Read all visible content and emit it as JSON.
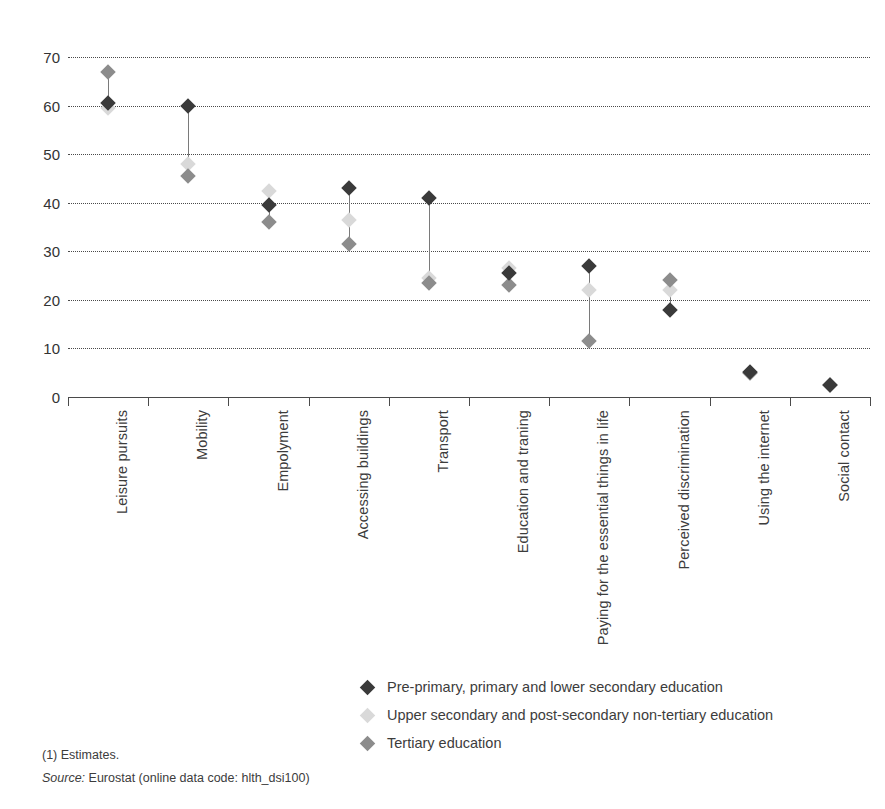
{
  "chart_data": {
    "type": "scatter",
    "title": "",
    "subtitle": "",
    "xlabel": "",
    "ylabel": "",
    "ylim": [
      0,
      70
    ],
    "ytick_step": 10,
    "yticks": [
      "70",
      "60",
      "50",
      "40",
      "30",
      "20",
      "10",
      "0"
    ],
    "grid": true,
    "grid_style": "dotted-horizontal",
    "legend_position": "bottom-center",
    "categories": [
      "Leisure pursuits",
      "Mobility",
      "Empolyment",
      "Accessing buildings",
      "Transport",
      "Education and traning",
      "Paying for the essential things in life",
      "Perceived discrimination",
      "Using the internet",
      "Social contact"
    ],
    "series": [
      {
        "name": "Pre-primary, primary and lower secondary education",
        "key": "pre",
        "color": "#3a3a3a",
        "marker": "diamond",
        "values": [
          60.5,
          60.0,
          39.5,
          43.0,
          41.0,
          25.5,
          27.0,
          18.0,
          5.2,
          2.5
        ]
      },
      {
        "name": "Upper secondary and post-secondary non-tertiary education",
        "key": "upper",
        "color": "#d9d9d9",
        "marker": "diamond",
        "values": [
          59.5,
          48.0,
          42.5,
          36.5,
          24.5,
          26.5,
          22.0,
          22.0,
          5.0,
          2.5
        ]
      },
      {
        "name": "Tertiary education",
        "key": "tertiary",
        "color": "#8c8c8c",
        "marker": "diamond",
        "values": [
          67.0,
          45.5,
          36.0,
          31.5,
          23.5,
          23.0,
          11.5,
          24.0,
          5.0,
          2.5
        ]
      }
    ]
  },
  "legend": {
    "items": [
      {
        "label": "Pre-primary, primary and lower secondary education",
        "color": "#3a3a3a"
      },
      {
        "label": "Upper secondary and post-secondary non-tertiary education",
        "color": "#d9d9d9"
      },
      {
        "label": "Tertiary education",
        "color": "#8c8c8c"
      }
    ]
  },
  "footnotes": {
    "estimates": "(1) Estimates.",
    "source_word": "Source:",
    "source_text": "Eurostat (online data code: hlth_dsi100)"
  }
}
